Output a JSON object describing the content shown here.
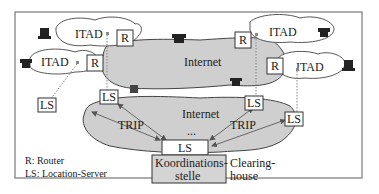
{
  "diagram": {
    "type": "network-architecture",
    "domains": [
      {
        "id": "itad-top-left",
        "label": "ITAD"
      },
      {
        "id": "itad-mid-left",
        "label": "ITAD"
      },
      {
        "id": "itad-top-right",
        "label": "ITAD"
      },
      {
        "id": "itad-mid-right",
        "label": "ITAD"
      }
    ],
    "routers": [
      {
        "id": "r-top-left",
        "label": "R"
      },
      {
        "id": "r-mid-left",
        "label": "R"
      },
      {
        "id": "r-top-right",
        "label": "R"
      },
      {
        "id": "r-mid-right",
        "label": "R"
      }
    ],
    "clouds": {
      "upper_internet": "Internet",
      "lower_internet": "Internet",
      "ellipsis": "..."
    },
    "location_servers": [
      {
        "id": "ls-far-left",
        "label": "LS"
      },
      {
        "id": "ls-left",
        "label": "LS"
      },
      {
        "id": "ls-right",
        "label": "LS"
      },
      {
        "id": "ls-far-right",
        "label": "LS"
      },
      {
        "id": "ls-center",
        "label": "LS"
      }
    ],
    "protocol_labels": {
      "left": "TRIP",
      "right": "TRIP"
    },
    "clearinghouse": {
      "box_line1": "Koordinations-",
      "box_line2": "stelle",
      "caption_line1": "Clearing-",
      "caption_line2": "house"
    },
    "legend": {
      "router": "R: Router",
      "location_server": "LS: Location-Server"
    },
    "colors": {
      "cloud_fill": "#cfcfcf",
      "box_fill": "#ffffff",
      "clearinghouse_fill": "#d4d4d4",
      "stroke": "#333333"
    }
  }
}
